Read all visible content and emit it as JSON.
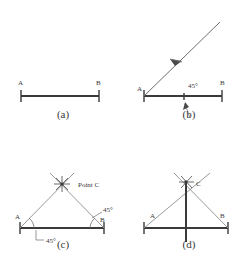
{
  "figure": {
    "width": 252,
    "height": 261,
    "background_color": "#ffffff",
    "line_color": "#3a3a3a",
    "construction_line_color": "#8d8d8d"
  },
  "panels": [
    {
      "id": "a",
      "caption": "(a)",
      "description": "Given base segment AB drawn with end ticks",
      "labels": {
        "a": "A",
        "b": "B"
      },
      "baseline": {
        "x1": 20,
        "y1": 96,
        "x2": 100,
        "y2": 96
      }
    },
    {
      "id": "b",
      "caption": "(b)",
      "description": "A 45 degree ray constructed at endpoint A",
      "labels": {
        "a": "A",
        "b": "B"
      },
      "angle": "45°",
      "baseline": {
        "x1": 18,
        "y1": 96,
        "x2": 98,
        "y2": 96
      }
    },
    {
      "id": "c",
      "caption": "(c)",
      "description": "Both 45 degree rays drawn from A and B meeting at point C",
      "labels": {
        "a": "A",
        "b": "B",
        "point_c": "Point C"
      },
      "angle_left": "45°",
      "angle_right": "45°",
      "baseline": {
        "x1": 20,
        "y1": 98,
        "x2": 105,
        "y2": 98
      }
    },
    {
      "id": "d",
      "caption": "(d)",
      "description": "Completed triangle ABC with vertical altitude through C",
      "labels": {
        "a": "A",
        "b": "B",
        "c": "C"
      },
      "baseline": {
        "x1": 18,
        "y1": 98,
        "x2": 103,
        "y2": 98
      }
    }
  ]
}
